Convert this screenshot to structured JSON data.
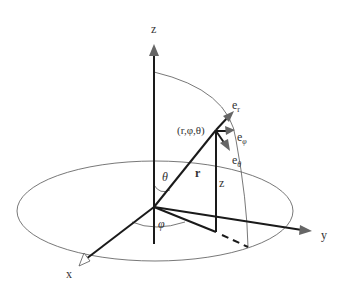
{
  "diagram": {
    "axes": {
      "x": "x",
      "y": "y",
      "z": "z"
    },
    "point_label": "(r,φ,θ)",
    "radius_label": "r",
    "height_label": "z",
    "theta_label": "θ",
    "phi_label": "φ",
    "unit_vectors": {
      "e_r": {
        "base": "e",
        "sub": "r"
      },
      "e_phi": {
        "base": "e",
        "sub": "φ"
      },
      "e_theta": {
        "base": "e",
        "sub": "θ"
      }
    },
    "colors": {
      "thick_line": "#1a1a1a",
      "thin_line": "#555555",
      "arrow_head": "#666666",
      "text": "#333333"
    }
  }
}
